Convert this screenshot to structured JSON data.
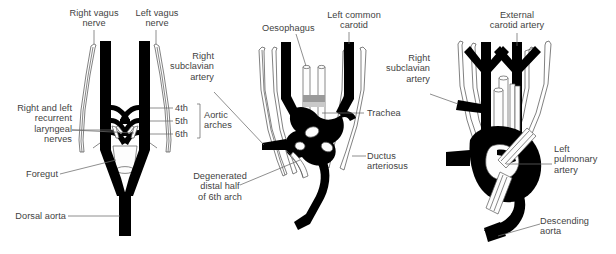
{
  "figure": {
    "background": "#ffffff",
    "vessel_color": "#000000",
    "text_color": "#3f3f3f",
    "leader_color": "#6a6a6a"
  },
  "panels": [
    {
      "id": "panel-left",
      "name": "early-pharyngeal-arch-arteries",
      "labels": {
        "right_vagus_nerve": "Right vagus\nnerve",
        "left_vagus_nerve": "Left vagus\nnerve",
        "recurrent_laryngeal": "Right and left\nrecurrent\nlaryngeal\nnerves",
        "foregut": "Foregut",
        "dorsal_aorta": "Dorsal aorta",
        "arch4": "4th",
        "arch5": "5th",
        "arch6": "6th",
        "aortic_arches": "Aortic\narches"
      }
    },
    {
      "id": "panel-middle",
      "name": "remodelling-aortic-arches",
      "labels": {
        "oesophagus": "Oesophagus",
        "left_common_carotid": "Left common\ncarotid",
        "right_subclavian_artery": "Right\nsubclavian\nartery",
        "trachea": "Trachea",
        "ductus_arteriosus": "Ductus\narteriosus",
        "degenerated_6th_arch": "Degenerated\ndistal half\nof 6th arch"
      }
    },
    {
      "id": "panel-right",
      "name": "mature-aortic-arch",
      "labels": {
        "external_carotid_artery": "External\ncarotid artery",
        "right_subclavian_artery": "Right\nsubclavian\nartery",
        "left_pulmonary_artery": "Left\npulmonary\nartery",
        "descending_aorta": "Descending\naorta"
      }
    }
  ]
}
